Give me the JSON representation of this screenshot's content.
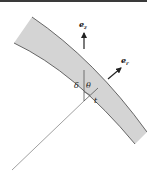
{
  "figure": {
    "type": "schematic of curved shell segment with local basis vectors",
    "colors": {
      "band_fill": "#d4d4d4",
      "band_stroke": "#444444",
      "line": "#555555",
      "text": "#222222",
      "top_border": "#3a3a3a"
    },
    "vectors": [
      {
        "name": "e_z",
        "base": "e",
        "subscript": "z",
        "direction": "up"
      },
      {
        "name": "e_r",
        "base": "e",
        "subscript": "r",
        "direction": "up-right (normal to band)"
      }
    ],
    "labels": {
      "delta": "δ",
      "theta": "θ",
      "thickness": "t"
    }
  }
}
